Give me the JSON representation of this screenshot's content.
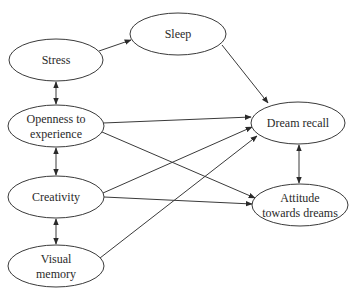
{
  "diagram": {
    "type": "path-model",
    "nodes": [
      {
        "id": "stress",
        "lines": [
          "Stress"
        ],
        "cx": 56,
        "cy": 60,
        "rx": 47,
        "ry": 21
      },
      {
        "id": "sleep",
        "lines": [
          "Sleep"
        ],
        "cx": 178,
        "cy": 34,
        "rx": 48,
        "ry": 21
      },
      {
        "id": "openness",
        "lines": [
          "Openness to",
          "experience"
        ],
        "cx": 56,
        "cy": 126,
        "rx": 48,
        "ry": 21
      },
      {
        "id": "creativity",
        "lines": [
          "Creativity"
        ],
        "cx": 56,
        "cy": 197,
        "rx": 48,
        "ry": 21
      },
      {
        "id": "visual_memory",
        "lines": [
          "Visual",
          "memory"
        ],
        "cx": 56,
        "cy": 266,
        "rx": 48,
        "ry": 21
      },
      {
        "id": "dream_recall",
        "lines": [
          "Dream recall"
        ],
        "cx": 298,
        "cy": 123,
        "rx": 47,
        "ry": 21
      },
      {
        "id": "attitude",
        "lines": [
          "Attitude",
          "towards dreams"
        ],
        "cx": 300,
        "cy": 205,
        "rx": 48,
        "ry": 21
      }
    ],
    "edges": [
      {
        "from": "stress",
        "to": "sleep",
        "type": "directed",
        "x1": 99,
        "y1": 51,
        "x2": 131,
        "y2": 40
      },
      {
        "from": "sleep",
        "to": "dream_recall",
        "type": "directed",
        "x1": 222,
        "y1": 45,
        "x2": 268,
        "y2": 103
      },
      {
        "from": "stress",
        "to": "openness",
        "type": "bidirectional",
        "x1": 56,
        "y1": 82,
        "x2": 56,
        "y2": 104
      },
      {
        "from": "openness",
        "to": "creativity",
        "type": "bidirectional",
        "x1": 56,
        "y1": 148,
        "x2": 56,
        "y2": 175
      },
      {
        "from": "creativity",
        "to": "visual_memory",
        "type": "bidirectional",
        "x1": 56,
        "y1": 219,
        "x2": 56,
        "y2": 244
      },
      {
        "from": "dream_recall",
        "to": "attitude",
        "type": "bidirectional",
        "x1": 299,
        "y1": 145,
        "x2": 299,
        "y2": 183
      },
      {
        "from": "openness",
        "to": "dream_recall",
        "type": "directed",
        "x1": 103,
        "y1": 123,
        "x2": 251,
        "y2": 117
      },
      {
        "from": "openness",
        "to": "attitude",
        "type": "directed",
        "x1": 102,
        "y1": 132,
        "x2": 255,
        "y2": 198
      },
      {
        "from": "creativity",
        "to": "dream_recall",
        "type": "directed",
        "x1": 103,
        "y1": 193,
        "x2": 252,
        "y2": 127
      },
      {
        "from": "creativity",
        "to": "attitude",
        "type": "directed",
        "x1": 104,
        "y1": 197,
        "x2": 252,
        "y2": 204
      },
      {
        "from": "visual_memory",
        "to": "dream_recall",
        "type": "directed",
        "x1": 100,
        "y1": 258,
        "x2": 257,
        "y2": 136
      }
    ],
    "colors": {
      "stroke": "#3a3a3a",
      "fill": "#ffffff",
      "text": "#2a2a2a",
      "background": "#ffffff"
    }
  }
}
